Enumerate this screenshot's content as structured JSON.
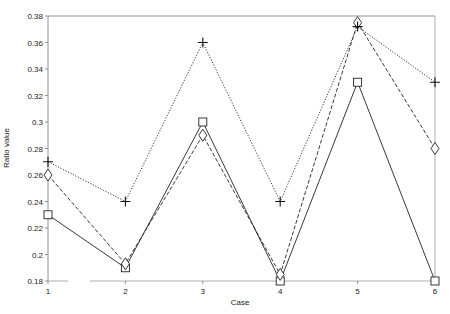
{
  "chart_data": {
    "type": "line",
    "title": "",
    "xlabel": "Case",
    "ylabel": "Ratio value",
    "categories": [
      "1",
      "2",
      "3",
      "4",
      "5",
      "6"
    ],
    "x": [
      1,
      2,
      3,
      4,
      5,
      6
    ],
    "ylim": [
      0.18,
      0.38
    ],
    "yticks": [
      0.18,
      0.2,
      0.22,
      0.24,
      0.26,
      0.28,
      0.3,
      0.32,
      0.34,
      0.36,
      0.38
    ],
    "ytick_labels": [
      "0.18",
      "0.2",
      "0.22",
      "0.24",
      "0.26",
      "0.28",
      "0.3",
      "0.32",
      "0.34",
      "0.36",
      "0.38"
    ],
    "grid": false,
    "legend": null,
    "series": [
      {
        "name": "square-solid",
        "marker": "square",
        "line": "solid",
        "values": [
          0.23,
          0.19,
          0.3,
          0.18,
          0.33,
          0.18
        ]
      },
      {
        "name": "diamond-dashed",
        "marker": "diamond",
        "line": "dashed",
        "values": [
          0.26,
          0.193,
          0.29,
          0.185,
          0.375,
          0.28
        ]
      },
      {
        "name": "plus-dotted",
        "marker": "plus",
        "line": "dotted",
        "values": [
          0.27,
          0.24,
          0.36,
          0.24,
          0.372,
          0.33
        ]
      }
    ]
  }
}
